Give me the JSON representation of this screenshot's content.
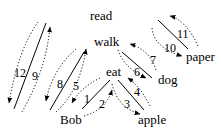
{
  "diagram": {
    "type": "dependency-tree-traversal",
    "words": {
      "read": "read",
      "walk": "walk",
      "eat": "eat",
      "dog": "dog",
      "paper": "paper",
      "Bob": "Bob",
      "apple": "apple"
    },
    "edges": [
      {
        "from": "read",
        "to": "Bob",
        "labels": [
          "12",
          "9"
        ]
      },
      {
        "from": "walk",
        "to": "Bob",
        "labels": [
          "8",
          "5"
        ]
      },
      {
        "from": "eat",
        "to": "Bob",
        "labels": [
          "1",
          "2"
        ]
      },
      {
        "from": "eat",
        "to": "apple",
        "labels": [
          "3",
          "4"
        ]
      },
      {
        "from": "walk",
        "to": "dog",
        "labels": [
          "6",
          "7"
        ]
      },
      {
        "from": "dog",
        "to": "paper",
        "labels": [
          "10",
          "11"
        ]
      }
    ],
    "step_labels": {
      "s1": "1",
      "s2": "2",
      "s3": "3",
      "s4": "4",
      "s5": "5",
      "s6": "6",
      "s7": "7",
      "s8": "8",
      "s9": "9",
      "s10": "10",
      "s11": "11",
      "s12": "12"
    },
    "colors": {
      "line": "#000000",
      "background": "#ffffff"
    }
  }
}
